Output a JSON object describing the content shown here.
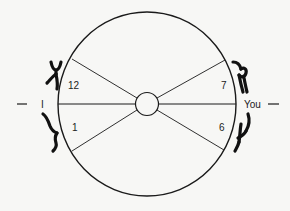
{
  "diagram": {
    "left_label": "I",
    "right_label": "You",
    "left_dash": "—",
    "right_dash": "—",
    "sector_labels": {
      "upper_left": "12",
      "lower_left": "1",
      "upper_right": "7",
      "lower_right": "6"
    },
    "glyphs": [
      {
        "position": "upper-left",
        "semantic": "hand-glyph"
      },
      {
        "position": "lower-left",
        "semantic": "hand-glyph"
      },
      {
        "position": "upper-right",
        "semantic": "hand-glyph"
      },
      {
        "position": "lower-right",
        "semantic": "hand-glyph"
      }
    ],
    "colors": {
      "stroke": "#1a1a1a",
      "background": "#f7f7f5"
    }
  }
}
